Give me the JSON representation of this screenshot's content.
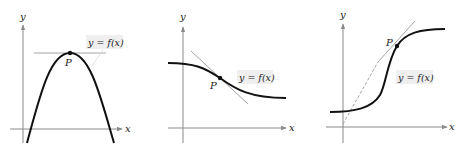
{
  "figure": {
    "panels": [
      {
        "id": "panel-1",
        "description": "Concave-down parabola with horizontal tangent at maximum point P",
        "axis_labels": {
          "x": "x",
          "y": "y"
        },
        "function_label": "y = f(x)",
        "point_label": "P"
      },
      {
        "id": "panel-2",
        "description": "Decreasing S-curve with tangent line through inflection point P",
        "axis_labels": {
          "x": "x",
          "y": "y"
        },
        "function_label": "y = f(x)",
        "point_label": "P"
      },
      {
        "id": "panel-3",
        "description": "Increasing S-curve with steep tangent line through point P (dashed extension)",
        "axis_labels": {
          "x": "x",
          "y": "y"
        },
        "function_label": "y = f(x)",
        "point_label": "P"
      }
    ],
    "colors": {
      "axis": "#8a8a8a",
      "curve": "#111111",
      "tangent": "#9a9a9a",
      "label_bg": "#efefef",
      "text": "#222222"
    }
  }
}
